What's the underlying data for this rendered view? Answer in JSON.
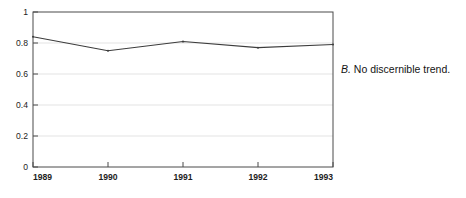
{
  "figure": {
    "panel_letter": "B.",
    "caption_text": "No discernible trend.",
    "background_color": "#ffffff",
    "line_color": "#3c3c3c",
    "grid_color": "#d8d8d8",
    "axis_color": "#555555"
  },
  "chart_data": {
    "type": "line",
    "title": "",
    "xlabel": "",
    "ylabel": "",
    "categories": [
      "1989",
      "1990",
      "1991",
      "1992",
      "1993"
    ],
    "values": [
      0.84,
      0.75,
      0.81,
      0.77,
      0.79
    ],
    "series": [
      {
        "name": "series-1",
        "values": [
          0.84,
          0.75,
          0.81,
          0.77,
          0.79
        ]
      }
    ],
    "ylim": [
      0,
      1
    ],
    "yticks": [
      "0",
      "0.2",
      "0.4",
      "0.6",
      "0.8",
      "1"
    ],
    "ytick_values": [
      0,
      0.2,
      0.4,
      0.6,
      0.8,
      1
    ],
    "xticks": [
      "1989",
      "1990",
      "1991",
      "1992",
      "1993"
    ],
    "grid": true,
    "grid_axis": "y",
    "legend": false,
    "legend_position": "none",
    "markers": true
  }
}
